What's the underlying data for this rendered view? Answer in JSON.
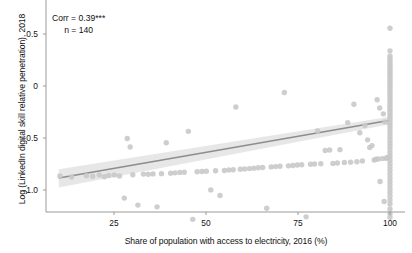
{
  "chart_data": {
    "type": "scatter",
    "title": "",
    "xlabel": "Share of population with access to electricity, 2016 (%)",
    "ylabel": "Log (LinkedIn digital skill relative penetration), 2018",
    "xlim": [
      8,
      103
    ],
    "ylim": [
      -1.42,
      0.72
    ],
    "xticks": [
      25,
      50,
      75,
      100
    ],
    "xtick_labels": [
      "25",
      "50",
      "75",
      "100"
    ],
    "yticks": [
      0.5,
      0,
      -0.5,
      -1.0
    ],
    "ytick_labels": [
      "0.5",
      "0",
      "-0.5",
      "-1.0"
    ],
    "grid": false,
    "legend": null,
    "annotations": [
      {
        "name": "correlation",
        "text": "Corr = 0.39***"
      },
      {
        "name": "sample-size",
        "text": "n = 140"
      }
    ],
    "point_color": "#c9c9c9",
    "line_color": "#8d8d8d",
    "band_color": "#e3e3e3",
    "axis_color": "#9a9a9a",
    "fit_line": {
      "x": [
        10,
        100
      ],
      "y": [
        -0.885,
        -0.33
      ],
      "ci_upper": [
        -0.8,
        -0.295
      ],
      "ci_lower": [
        -0.975,
        -0.368
      ]
    },
    "points": [
      [
        10.3,
        -0.865
      ],
      [
        13.5,
        -0.875
      ],
      [
        17.5,
        -0.862
      ],
      [
        19.2,
        -0.868
      ],
      [
        21.0,
        -0.855
      ],
      [
        22.4,
        -0.872
      ],
      [
        23.6,
        -0.86
      ],
      [
        25.1,
        -0.855
      ],
      [
        26.5,
        -0.865
      ],
      [
        27.8,
        -1.078
      ],
      [
        28.6,
        -0.505
      ],
      [
        29.4,
        -0.586
      ],
      [
        30.1,
        -0.854
      ],
      [
        31.5,
        -1.145
      ],
      [
        33.0,
        -0.847
      ],
      [
        34.3,
        -0.848
      ],
      [
        35.6,
        -0.845
      ],
      [
        36.7,
        -1.162
      ],
      [
        37.9,
        -0.843
      ],
      [
        39.2,
        -0.545
      ],
      [
        40.4,
        -0.838
      ],
      [
        41.6,
        -0.835
      ],
      [
        42.9,
        -0.831
      ],
      [
        44.1,
        -0.83
      ],
      [
        45.2,
        -0.436
      ],
      [
        46.4,
        -1.282
      ],
      [
        47.6,
        -0.825
      ],
      [
        48.9,
        -0.822
      ],
      [
        50.1,
        -0.82
      ],
      [
        51.3,
        -0.999
      ],
      [
        52.6,
        -0.815
      ],
      [
        53.8,
        -1.052
      ],
      [
        55.0,
        -0.812
      ],
      [
        56.2,
        -0.808
      ],
      [
        57.4,
        -0.805
      ],
      [
        58.1,
        -0.202
      ],
      [
        59.3,
        -0.8
      ],
      [
        60.5,
        -0.797
      ],
      [
        61.8,
        -0.794
      ],
      [
        63.0,
        -0.79
      ],
      [
        64.2,
        -0.786
      ],
      [
        65.4,
        -0.783
      ],
      [
        66.5,
        -1.175
      ],
      [
        67.7,
        -0.778
      ],
      [
        68.9,
        -0.775
      ],
      [
        70.1,
        -0.772
      ],
      [
        71.3,
        -0.062
      ],
      [
        72.4,
        -0.768
      ],
      [
        73.6,
        -0.765
      ],
      [
        74.8,
        -0.76
      ],
      [
        76.0,
        -0.757
      ],
      [
        77.2,
        -1.258
      ],
      [
        78.4,
        -0.753
      ],
      [
        79.5,
        -0.75
      ],
      [
        80.3,
        -0.432
      ],
      [
        81.2,
        -0.748
      ],
      [
        82.4,
        -0.62
      ],
      [
        83.6,
        -0.615
      ],
      [
        84.5,
        -0.744
      ],
      [
        85.7,
        -0.74
      ],
      [
        86.4,
        -0.612
      ],
      [
        87.6,
        -0.736
      ],
      [
        88.5,
        -0.352
      ],
      [
        89.3,
        -0.732
      ],
      [
        90.2,
        -0.175
      ],
      [
        91.0,
        -0.728
      ],
      [
        91.8,
        -0.45
      ],
      [
        92.5,
        -0.72
      ],
      [
        93.2,
        -0.38
      ],
      [
        93.9,
        -0.518
      ],
      [
        94.5,
        -0.592
      ],
      [
        95.1,
        -0.573
      ],
      [
        95.7,
        -0.712
      ],
      [
        96.2,
        -0.705
      ],
      [
        96.8,
        -0.702
      ],
      [
        97.3,
        -0.918
      ],
      [
        97.9,
        -0.698
      ],
      [
        98.4,
        -1.11
      ],
      [
        98.9,
        -0.695
      ],
      [
        99.2,
        -0.69
      ],
      [
        99.5,
        -0.688
      ],
      [
        99.7,
        -0.686
      ],
      [
        100,
        0.555
      ],
      [
        100,
        0.338
      ],
      [
        100,
        0.288
      ],
      [
        100,
        0.262
      ],
      [
        100,
        0.238
      ],
      [
        100,
        0.215
      ],
      [
        100,
        0.192
      ],
      [
        100,
        0.168
      ],
      [
        100,
        0.148
      ],
      [
        100,
        0.128
      ],
      [
        100,
        0.108
      ],
      [
        100,
        0.088
      ],
      [
        100,
        0.068
      ],
      [
        100,
        0.045
      ],
      [
        100,
        0.022
      ],
      [
        100,
        0.0
      ],
      [
        100,
        -0.022
      ],
      [
        100,
        -0.045
      ],
      [
        100,
        -0.068
      ],
      [
        100,
        -0.092
      ],
      [
        100,
        -0.115
      ],
      [
        100,
        -0.138
      ],
      [
        100,
        -0.162
      ],
      [
        100,
        -0.185
      ],
      [
        100,
        -0.208
      ],
      [
        100,
        -0.232
      ],
      [
        100,
        -0.255
      ],
      [
        100,
        -0.278
      ],
      [
        100,
        -0.302
      ],
      [
        100,
        -0.325
      ],
      [
        100,
        -0.352
      ],
      [
        100,
        -0.378
      ],
      [
        100,
        -0.405
      ],
      [
        100,
        -0.432
      ],
      [
        100,
        -0.462
      ],
      [
        100,
        -0.492
      ],
      [
        100,
        -0.522
      ],
      [
        100,
        -0.552
      ],
      [
        100,
        -0.582
      ],
      [
        100,
        -0.612
      ],
      [
        100,
        -0.645
      ],
      [
        100,
        -0.678
      ],
      [
        100,
        -0.712
      ],
      [
        100,
        -0.745
      ],
      [
        100,
        -0.778
      ],
      [
        100,
        -0.812
      ],
      [
        100,
        -0.848
      ],
      [
        100,
        -0.885
      ],
      [
        100,
        -0.918
      ],
      [
        100,
        -0.952
      ],
      [
        100,
        -0.988
      ],
      [
        100,
        -1.022
      ],
      [
        100,
        -1.058
      ],
      [
        100,
        -1.095
      ],
      [
        100,
        -1.135
      ],
      [
        100,
        -1.182
      ],
      [
        100,
        -1.228
      ],
      [
        100,
        -1.262
      ],
      [
        98.2,
        -0.268
      ],
      [
        98.6,
        -0.345
      ],
      [
        97.2,
        -0.212
      ],
      [
        96.5,
        -0.132
      ]
    ]
  }
}
